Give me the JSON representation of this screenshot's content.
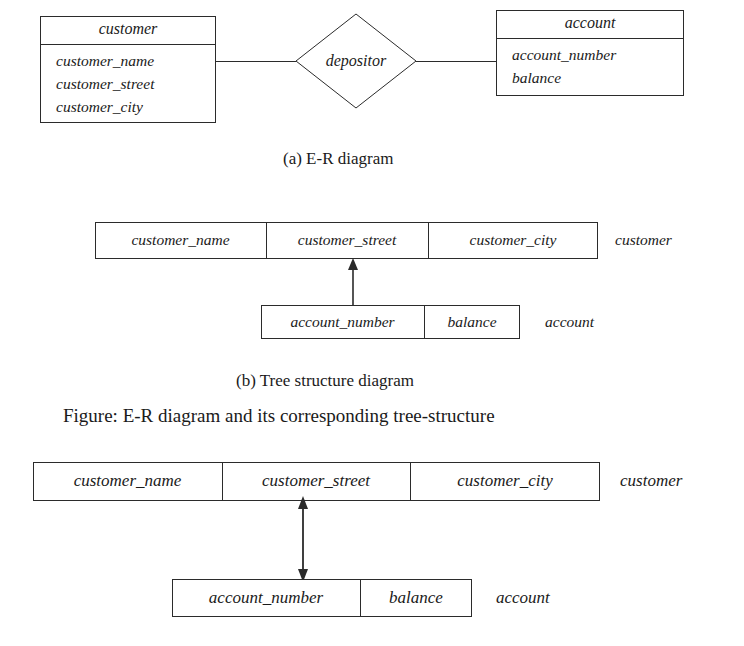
{
  "figure": {
    "caption": "Figure: E-R diagram and its corresponding tree-structure"
  },
  "er_diagram": {
    "caption": "(a) E-R diagram",
    "customer_entity": {
      "title": "customer",
      "attributes": [
        "customer_name",
        "customer_street",
        "customer_city"
      ]
    },
    "relationship": {
      "label": "depositor",
      "shape": "diamond"
    },
    "account_entity": {
      "title": "account",
      "attributes": [
        "account_number",
        "balance"
      ]
    }
  },
  "tree_diagram_small": {
    "caption": "(b) Tree structure diagram",
    "customer_record": {
      "fields": [
        "customer_name",
        "customer_street",
        "customer_city"
      ],
      "side_label": "customer"
    },
    "account_record": {
      "fields": [
        "account_number",
        "balance"
      ],
      "side_label": "account"
    },
    "link": {
      "type": "single-headed-arrow",
      "direction": "up",
      "from": "account_record",
      "to": "customer_record"
    }
  },
  "tree_diagram_large": {
    "customer_record": {
      "fields": [
        "customer_name",
        "customer_street",
        "customer_city"
      ],
      "side_label": "customer"
    },
    "account_record": {
      "fields": [
        "account_number",
        "balance"
      ],
      "side_label": "account"
    },
    "link": {
      "type": "double-headed-arrow",
      "direction": "up-down",
      "from": "account_record",
      "to": "customer_record"
    }
  },
  "colors": {
    "ink": "#1a1a1a",
    "stroke": "#2b2b2b",
    "paper": "#ffffff"
  }
}
